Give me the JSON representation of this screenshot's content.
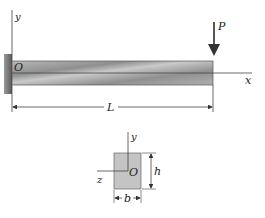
{
  "figure": {
    "beam": {
      "origin_label": "O",
      "y_axis_label": "y",
      "x_axis_label": "x",
      "load_label": "P",
      "length_label": "L"
    },
    "cross_section": {
      "y_axis_label": "y",
      "z_axis_label": "z",
      "origin_label": "O",
      "height_label": "h",
      "width_label": "b"
    },
    "colors": {
      "beam_fill": "#a9a9a9",
      "section_fill": "#c4c4c4",
      "wall_fill": "#6e6e6e",
      "line": "#333333"
    }
  }
}
